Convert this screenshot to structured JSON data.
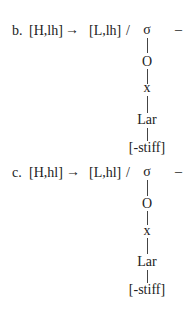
{
  "rules": [
    {
      "label": "b.",
      "input": "[H,lh]",
      "arrow": "→",
      "output": "[L,lh]",
      "slash": "/",
      "tree": [
        "σ",
        "O",
        "x",
        "Lar",
        "[-stiff]"
      ],
      "dash": "–"
    },
    {
      "label": "c.",
      "input": "[H,hl]",
      "arrow": "→",
      "output": "[L,hl]",
      "slash": "/",
      "tree": [
        "σ",
        "O",
        "x",
        "Lar",
        "[-stiff]"
      ],
      "dash": "–"
    }
  ]
}
